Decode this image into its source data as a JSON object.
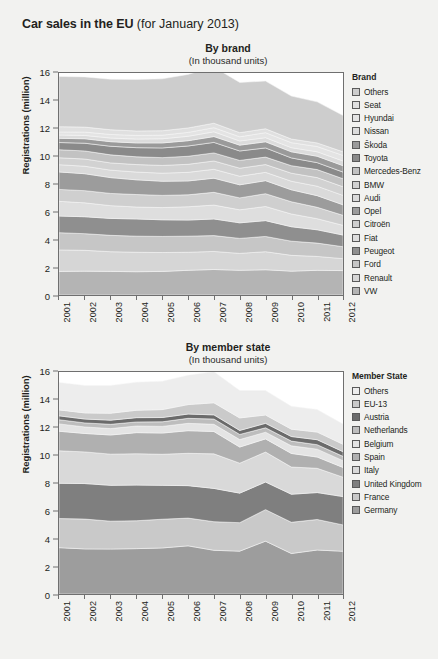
{
  "header": {
    "title_strong": "Car sales in the EU",
    "title_light": " (for January 2013)"
  },
  "panels": [
    {
      "title": "By brand",
      "subtitle": "(In thousand units)",
      "ylabel": "Registrations (million)",
      "legend_title": "Brand"
    },
    {
      "title": "By member state",
      "subtitle": "(In thousand units)",
      "ylabel": "Registrations (million)",
      "legend_title": "Member State"
    }
  ],
  "chart_data": [
    {
      "type": "area",
      "title": "By brand",
      "subtitle": "(In thousand units)",
      "xlabel": "",
      "ylabel": "Registrations (million)",
      "ylim": [
        0,
        16
      ],
      "yticks": [
        0,
        2,
        4,
        6,
        8,
        10,
        12,
        14,
        16
      ],
      "grid": false,
      "legend_position": "right",
      "legend_title": "Brand",
      "stacked": true,
      "stack_order": "bottom-to-top",
      "categories": [
        "2001",
        "2002",
        "2003",
        "2004",
        "2005",
        "2006",
        "2007",
        "2008",
        "2009",
        "2010",
        "2011",
        "2012"
      ],
      "series": [
        {
          "name": "VW",
          "color": "#b4b4b4",
          "values": [
            1.7,
            1.72,
            1.7,
            1.68,
            1.7,
            1.78,
            1.84,
            1.78,
            1.82,
            1.72,
            1.78,
            1.76
          ]
        },
        {
          "name": "Renault",
          "color": "#d6d6d6",
          "values": [
            1.55,
            1.5,
            1.42,
            1.4,
            1.36,
            1.3,
            1.3,
            1.22,
            1.3,
            1.14,
            1.0,
            0.86
          ]
        },
        {
          "name": "Ford",
          "color": "#c6c6c6",
          "values": [
            1.24,
            1.2,
            1.18,
            1.16,
            1.16,
            1.16,
            1.14,
            1.08,
            1.1,
            1.02,
            0.96,
            0.86
          ]
        },
        {
          "name": "Peugeot",
          "color": "#8f8f8f",
          "values": [
            1.2,
            1.22,
            1.22,
            1.24,
            1.2,
            1.16,
            1.2,
            1.12,
            1.14,
            1.04,
            0.96,
            0.84
          ]
        },
        {
          "name": "Fiat",
          "color": "#dedede",
          "values": [
            1.06,
            1.0,
            0.92,
            0.86,
            0.88,
            0.96,
            1.0,
            0.94,
            1.02,
            0.92,
            0.8,
            0.7
          ]
        },
        {
          "name": "Citroën",
          "color": "#cfcfcf",
          "values": [
            0.86,
            0.88,
            0.88,
            0.9,
            0.88,
            0.86,
            0.92,
            0.86,
            0.92,
            0.88,
            0.82,
            0.72
          ]
        },
        {
          "name": "Opel",
          "color": "#9c9c9c",
          "values": [
            1.26,
            1.22,
            1.14,
            1.06,
            1.02,
            1.0,
            1.02,
            0.94,
            0.94,
            0.86,
            0.84,
            0.76
          ]
        },
        {
          "name": "Audi",
          "color": "#dadada",
          "values": [
            0.52,
            0.54,
            0.54,
            0.56,
            0.58,
            0.62,
            0.64,
            0.62,
            0.6,
            0.62,
            0.68,
            0.68
          ]
        },
        {
          "name": "BMW",
          "color": "#d2d2d2",
          "values": [
            0.5,
            0.52,
            0.52,
            0.54,
            0.56,
            0.58,
            0.6,
            0.58,
            0.56,
            0.58,
            0.62,
            0.62
          ]
        },
        {
          "name": "Mercedes-Benz",
          "color": "#c2c2c2",
          "values": [
            0.58,
            0.58,
            0.58,
            0.56,
            0.56,
            0.58,
            0.58,
            0.56,
            0.54,
            0.54,
            0.58,
            0.58
          ]
        },
        {
          "name": "Toyota",
          "color": "#8a8a8a",
          "values": [
            0.52,
            0.56,
            0.62,
            0.66,
            0.7,
            0.74,
            0.76,
            0.68,
            0.66,
            0.56,
            0.5,
            0.48
          ]
        },
        {
          "name": "Škoda",
          "color": "#9a9a9a",
          "values": [
            0.3,
            0.32,
            0.33,
            0.34,
            0.36,
            0.38,
            0.42,
            0.42,
            0.44,
            0.44,
            0.46,
            0.46
          ]
        },
        {
          "name": "Nissan",
          "color": "#dcdcdc",
          "values": [
            0.24,
            0.24,
            0.26,
            0.28,
            0.3,
            0.32,
            0.34,
            0.3,
            0.3,
            0.3,
            0.32,
            0.34
          ]
        },
        {
          "name": "Hyundai",
          "color": "#e4e4e4",
          "values": [
            0.22,
            0.24,
            0.26,
            0.26,
            0.26,
            0.28,
            0.3,
            0.3,
            0.36,
            0.36,
            0.38,
            0.4
          ]
        },
        {
          "name": "Seat",
          "color": "#e0e0e0",
          "values": [
            0.38,
            0.36,
            0.34,
            0.32,
            0.32,
            0.32,
            0.32,
            0.3,
            0.28,
            0.26,
            0.26,
            0.26
          ]
        },
        {
          "name": "Others",
          "color": "#cdcdcd",
          "values": [
            3.62,
            3.62,
            3.64,
            3.72,
            3.74,
            3.86,
            4.04,
            3.62,
            3.44,
            3.1,
            2.96,
            2.62
          ]
        }
      ]
    },
    {
      "type": "area",
      "title": "By member state",
      "subtitle": "(In thousand units)",
      "xlabel": "",
      "ylabel": "Registrations (million)",
      "ylim": [
        0,
        16
      ],
      "yticks": [
        0,
        2,
        4,
        6,
        8,
        10,
        12,
        14,
        16
      ],
      "grid": false,
      "legend_position": "right",
      "legend_title": "Member State",
      "stacked": true,
      "stack_order": "bottom-to-top",
      "categories": [
        "2001",
        "2002",
        "2003",
        "2004",
        "2005",
        "2006",
        "2007",
        "2008",
        "2009",
        "2010",
        "2011",
        "2012"
      ],
      "series": [
        {
          "name": "Germany",
          "color": "#9d9d9d",
          "values": [
            3.34,
            3.25,
            3.24,
            3.27,
            3.32,
            3.47,
            3.15,
            3.09,
            3.81,
            2.92,
            3.17,
            3.08
          ]
        },
        {
          "name": "France",
          "color": "#c9c9c9",
          "values": [
            2.1,
            2.15,
            2.01,
            2.01,
            2.07,
            2.0,
            2.06,
            2.05,
            2.27,
            2.25,
            2.2,
            1.9
          ]
        },
        {
          "name": "United Kingdom",
          "color": "#7f7f7f",
          "values": [
            2.54,
            2.56,
            2.58,
            2.57,
            2.44,
            2.34,
            2.4,
            2.13,
            1.99,
            2.02,
            1.94,
            2.04
          ]
        },
        {
          "name": "Italy",
          "color": "#d9d9d9",
          "values": [
            2.34,
            2.28,
            2.25,
            2.26,
            2.24,
            2.33,
            2.49,
            2.16,
            2.16,
            1.96,
            1.75,
            1.4
          ]
        },
        {
          "name": "Spain",
          "color": "#b0b0b0",
          "values": [
            1.41,
            1.33,
            1.38,
            1.52,
            1.53,
            1.63,
            1.61,
            1.16,
            0.95,
            0.98,
            0.81,
            0.7
          ]
        },
        {
          "name": "Belgium",
          "color": "#e4e4e4",
          "values": [
            0.53,
            0.47,
            0.46,
            0.48,
            0.48,
            0.53,
            0.52,
            0.54,
            0.48,
            0.55,
            0.57,
            0.49
          ]
        },
        {
          "name": "Netherlands",
          "color": "#bdbdbd",
          "values": [
            0.3,
            0.29,
            0.31,
            0.29,
            0.33,
            0.36,
            0.38,
            0.37,
            0.32,
            0.34,
            0.32,
            0.31
          ]
        },
        {
          "name": "Austria",
          "color": "#6b6b6b",
          "values": [
            0.28,
            0.28,
            0.3,
            0.31,
            0.31,
            0.31,
            0.3,
            0.29,
            0.32,
            0.33,
            0.36,
            0.34
          ]
        },
        {
          "name": "EU-13",
          "color": "#cacaca",
          "values": [
            0.43,
            0.44,
            0.5,
            0.53,
            0.57,
            0.68,
            0.87,
            0.9,
            0.6,
            0.53,
            0.55,
            0.53
          ]
        },
        {
          "name": "Others",
          "color": "#ededed",
          "values": [
            1.98,
            1.98,
            2.0,
            2.03,
            2.05,
            2.12,
            2.24,
            1.97,
            1.76,
            1.65,
            1.62,
            1.46
          ]
        }
      ]
    }
  ]
}
